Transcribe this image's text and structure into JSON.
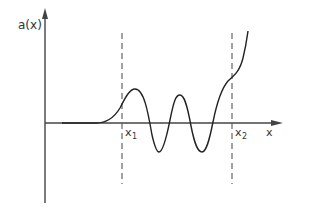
{
  "figure": {
    "y_axis_label": "a(x)",
    "x_axis_label": "x",
    "markers": [
      {
        "label": "x",
        "subscript": "1"
      },
      {
        "label": "x",
        "subscript": "2"
      }
    ],
    "colors": {
      "axis": "#444444",
      "curve": "#222222",
      "dashed": "#555555",
      "background": "#ffffff"
    }
  }
}
